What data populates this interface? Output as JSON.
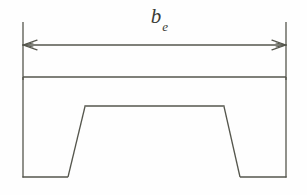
{
  "figure": {
    "kind": "engineering-line-drawing",
    "background_color": "#fefefe",
    "line_color": "#55564d",
    "label_color": "#3b3b36",
    "line_width": 1.3,
    "canvas": {
      "width": 307,
      "height": 195
    },
    "dimension": {
      "name": "effective-width",
      "symbol_base": "b",
      "symbol_subscript": "e",
      "label_text": "b",
      "arrow_y": 45,
      "left_x": 23,
      "right_x": 286,
      "extension_top_y": 22,
      "extension_bottom_y": 80,
      "arrowhead_length": 13,
      "arrowhead_half_height": 5
    },
    "outline": {
      "name": "plate-outline",
      "top_y": 77,
      "bottom_y": 177,
      "left_x": 23,
      "right_x": 286
    },
    "stiffener": {
      "name": "hat-stiffener-trapezoid",
      "top_left_x": 85,
      "top_right_x": 224,
      "top_y": 106,
      "bottom_left_x": 68,
      "bottom_right_x": 240,
      "bottom_y": 177
    }
  }
}
